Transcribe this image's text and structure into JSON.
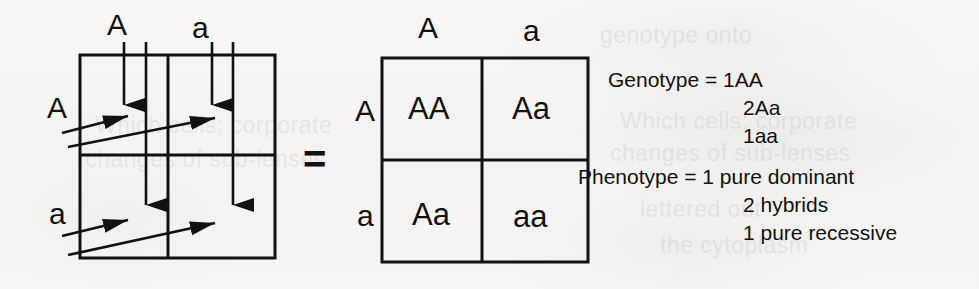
{
  "figure": {
    "equals_sign": "=",
    "ink_color": "#111111",
    "paper_color": "#f7f6f4"
  },
  "left_square": {
    "name": "gamete-arrow-grid",
    "column_headers": [
      "A",
      "a"
    ],
    "row_headers": [
      "A",
      "a"
    ],
    "cells": [
      [
        "",
        ""
      ],
      [
        "",
        ""
      ]
    ],
    "arrow_count_vertical": 4,
    "arrow_count_horizontal": 4
  },
  "right_square": {
    "name": "result-punnett-square",
    "column_headers": [
      "A",
      "a"
    ],
    "row_headers": [
      "A",
      "a"
    ],
    "cells": [
      [
        "AA",
        "Aa"
      ],
      [
        "Aa",
        "aa"
      ]
    ]
  },
  "results": {
    "genotype_label": "Genotype = 1AA",
    "genotype_lines": [
      "2Aa",
      "1aa"
    ],
    "phenotype_label": "Phenotype = 1 pure dominant",
    "phenotype_lines": [
      "2 hybrids",
      "1 pure recessive"
    ]
  },
  "ghost_text": {
    "line1": "genotype onto",
    "line2": "Which cells; corporate",
    "line3": "changes of sub-lenses",
    "line4": "lettered out",
    "line5": "the cytoplasm"
  }
}
